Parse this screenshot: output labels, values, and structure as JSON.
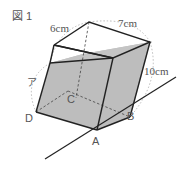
{
  "figure": {
    "title": "図 1",
    "dimension_labels": {
      "top_left": "6cm",
      "top_right": "7cm",
      "right": "10cm",
      "left": "ア"
    },
    "vertex_labels": {
      "A": "A",
      "B": "B",
      "C": "C",
      "D": "D"
    },
    "colors": {
      "water_fill": "#bdbdbd",
      "edge": "#222222",
      "dotted": "#999999"
    }
  }
}
